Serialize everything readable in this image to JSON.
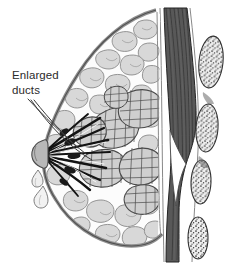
{
  "figure": {
    "background_color": "#ffffff"
  },
  "annotations": {
    "enlarged_ducts": {
      "line1": "Enlarged",
      "line2": "ducts",
      "text_color": "#2b2b2b",
      "leader_line_color": "#3a3a3a"
    }
  },
  "anatomy": {
    "skin_outline": {
      "name": "skin-outline",
      "color": "#8c8c8c"
    },
    "subcutaneous_fat": {
      "name": "fat-lobules",
      "fill": "#d9d9d9",
      "stroke": "#8a8a8a"
    },
    "glandular_lobules": {
      "name": "glandular-lobules",
      "fill": "#cfcfcf",
      "stroke": "#555555"
    },
    "ducts": {
      "name": "enlarged-ducts",
      "color": "#1a1a1a"
    },
    "nipple": {
      "name": "nipple",
      "fill": "#b5b5b5",
      "stroke": "#4a4a4a"
    },
    "discharge_droplets": {
      "name": "nipple-discharge-droplets",
      "fill": "#ededed",
      "stroke": "#7a7a7a",
      "count": 2
    },
    "pectoral_muscle": {
      "name": "pectoral-muscle",
      "fill": "#4f4f4f",
      "stroke": "#2e2e2e"
    },
    "ribs": {
      "name": "rib-cross-sections",
      "fill": "#e8e8e8",
      "stroke": "#3a3a3a",
      "count": 4
    },
    "chest_wall": {
      "name": "chest-wall",
      "fill": "#ffffff",
      "stroke": "#6e6e6e"
    }
  }
}
